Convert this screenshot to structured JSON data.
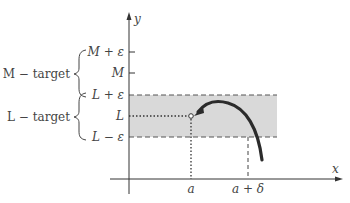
{
  "axes": {
    "x_label": "x",
    "y_label": "y"
  },
  "y_ticks": [
    {
      "id": "m-plus-eps",
      "label": "M + ε",
      "y": 52
    },
    {
      "id": "m",
      "label": "M",
      "y": 73
    },
    {
      "id": "l-plus-eps",
      "label": "L + ε",
      "y": 95
    },
    {
      "id": "l",
      "label": "L",
      "y": 116
    },
    {
      "id": "l-minus-eps",
      "label": "L − ε",
      "y": 137
    }
  ],
  "x_ticks": [
    {
      "id": "a",
      "label": "a"
    },
    {
      "id": "a-plus-delta",
      "label": "a + δ"
    }
  ],
  "brace_labels": {
    "m_target": "M − target",
    "l_target": "L − target"
  },
  "colors": {
    "band": "#d9d9d9",
    "curve": "#2b2b2b",
    "axis": "#333333",
    "text": "#444444"
  }
}
